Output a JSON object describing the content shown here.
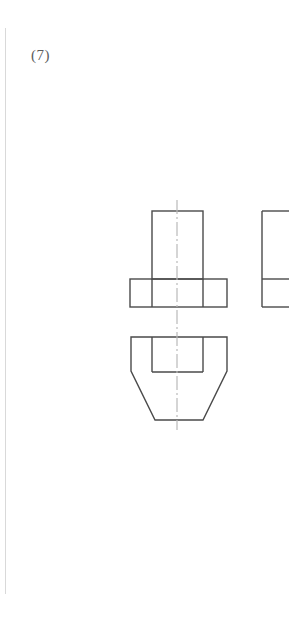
{
  "page": {
    "label": "(7)",
    "background_color": "#ffffff",
    "margin_rule_color": "#d9d9d9"
  },
  "drawing": {
    "line_color": "#4a4a4a",
    "centerline_color": "#b9b9b9",
    "stroke_width": 1.4,
    "title": "Orthographic projection exercise (7)",
    "views": [
      {
        "name": "front-view",
        "description": "T-shaped front view: tall upright rectangle seated on a wide base divided into three segments",
        "upright": {
          "x": 152,
          "y": 211,
          "width": 51,
          "height": 68
        },
        "base": {
          "x": 130,
          "y": 279,
          "width": 97,
          "height": 28
        },
        "base_dividers_x": [
          152,
          203
        ]
      },
      {
        "name": "top-view",
        "description": "Chamfered octagonal outline with inner rectangle showing the upright footprint",
        "outline_points": "131,337 227,337 227,371 203,420 155,420 131,371",
        "inner_rect": {
          "x": 152,
          "y": 337,
          "width": 51,
          "height": 35
        }
      },
      {
        "name": "side-view-partial",
        "description": "Partially cropped side view at the right page edge, aligned with the front view heights",
        "rect": {
          "x": 262,
          "y": 211,
          "width": 27,
          "height": 96
        },
        "divider_y": 279,
        "cropped_edge": "right"
      }
    ],
    "centerline": {
      "name": "vertical-centerline",
      "x": 177,
      "y_start": 200,
      "y_end": 430,
      "style": "dash-dot"
    }
  }
}
